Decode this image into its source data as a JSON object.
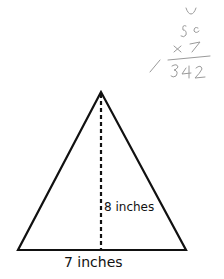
{
  "diagram": {
    "shape": "triangle",
    "height_label": "8 inches",
    "base_label": "7 inches",
    "line_color": "#111111",
    "handwriting_color": "#9a9a9a",
    "handwritten_notes": [
      "u",
      "56",
      "× 7",
      "392"
    ]
  }
}
